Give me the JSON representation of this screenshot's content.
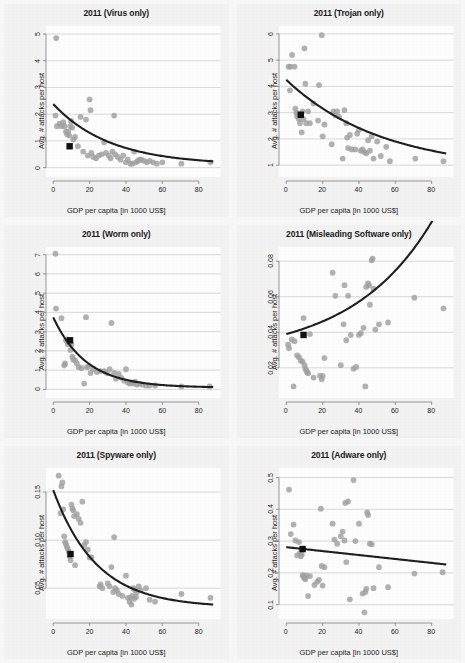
{
  "figure": {
    "title": "",
    "background_color": "#f4f4f4",
    "point_color": "#a0a0a0",
    "line_color": "#1f1f1f",
    "highlight_color": "#111111",
    "grid_color": "#c8c8c8",
    "axis_color": "#8a8a8a"
  },
  "shared": {
    "xlabel": "GDP per capita [in 1000 US$]",
    "ylabel": "Avg. # attacks per host",
    "xticks": [
      "0",
      "20",
      "40",
      "60",
      "80"
    ],
    "xtick_values": [
      0,
      20,
      40,
      60,
      80
    ],
    "xlim": [
      -4,
      92
    ]
  },
  "chart_data": [
    {
      "type": "scatter",
      "title": "2011 (Virus only)",
      "xlabel": "GDP per capita [in 1000 US$]",
      "ylabel": "Avg. # attacks per host",
      "xlim": [
        -4,
        92
      ],
      "ylim": [
        -0.35,
        5.3
      ],
      "xticks": [
        0,
        20,
        40,
        60,
        80
      ],
      "yticks": [
        0,
        1,
        2,
        3,
        4,
        5
      ],
      "ytick_labels": [
        "0",
        "1",
        "2",
        "3",
        "4",
        "5"
      ],
      "grid": true,
      "legend": "none",
      "x": [
        1.6,
        1.2,
        2.0,
        3.5,
        4.5,
        5.5,
        6.2,
        7.0,
        7.6,
        8.2,
        8.8,
        9.4,
        9.8,
        10.4,
        11.0,
        12.0,
        13.5,
        15.0,
        16.5,
        18.0,
        19.0,
        20.0,
        20.5,
        21.0,
        22.0,
        23.5,
        25.0,
        26.5,
        28.0,
        29.0,
        30.5,
        31.5,
        32.5,
        33.5,
        34.0,
        35.5,
        37.0,
        38.5,
        40.0,
        41.0,
        42.5,
        43.5,
        44.5,
        45.5,
        46.5,
        47.5,
        48.5,
        50.0,
        51.5,
        53.0,
        55.0,
        57.0,
        60.0,
        70.5,
        86.5
      ],
      "y": [
        4.85,
        1.95,
        1.55,
        1.65,
        1.55,
        1.7,
        1.55,
        1.35,
        1.25,
        1.35,
        1.2,
        1.55,
        1.75,
        1.5,
        1.05,
        1.15,
        0.8,
        1.9,
        0.6,
        1.8,
        0.45,
        2.55,
        2.15,
        0.55,
        0.4,
        0.35,
        0.45,
        0.5,
        0.95,
        0.55,
        0.45,
        0.35,
        0.6,
        1.95,
        0.5,
        0.4,
        0.3,
        0.45,
        0.2,
        0.3,
        0.15,
        0.15,
        0.6,
        0.2,
        0.25,
        0.3,
        0.3,
        0.25,
        0.2,
        0.25,
        0.2,
        0.15,
        0.2,
        0.15,
        0.2
      ],
      "highlight_point": {
        "x": 9.0,
        "y": 0.8,
        "marker": "square"
      },
      "fit_curve": {
        "kind": "exponential_decay",
        "a": 2.28,
        "b": 0.032,
        "c": 0.1,
        "x0": 0,
        "x1": 88
      }
    },
    {
      "type": "scatter",
      "title": "2011 (Trojan only)",
      "xlabel": "GDP per capita [in 1000 US$]",
      "ylabel": "Avg. # attacks per host",
      "xlim": [
        -4,
        92
      ],
      "ylim": [
        0.55,
        6.3
      ],
      "xticks": [
        0,
        20,
        40,
        60,
        80
      ],
      "yticks": [
        1,
        2,
        3,
        4,
        5,
        6
      ],
      "ytick_labels": [
        "1",
        "2",
        "3",
        "4",
        "5",
        "6"
      ],
      "grid": true,
      "legend": "none",
      "x": [
        1.3,
        2.0,
        2.2,
        3.2,
        4.5,
        5.0,
        5.5,
        6.0,
        6.5,
        7.0,
        7.5,
        8.0,
        8.5,
        9.0,
        9.5,
        10.0,
        10.5,
        11.0,
        12.0,
        13.0,
        15.0,
        17.5,
        18.0,
        19.5,
        20.0,
        21.0,
        25.0,
        26.0,
        27.0,
        28.0,
        29.0,
        31.0,
        32.0,
        33.0,
        33.5,
        34.0,
        35.0,
        36.0,
        38.0,
        39.0,
        40.0,
        41.0,
        42.0,
        43.0,
        44.0,
        45.0,
        46.0,
        47.0,
        48.0,
        50.0,
        52.0,
        55.0,
        57.0,
        71.0,
        86.5
      ],
      "y": [
        4.75,
        3.85,
        4.75,
        5.2,
        4.75,
        3.15,
        3.0,
        2.85,
        2.95,
        2.75,
        2.6,
        2.95,
        2.25,
        3.05,
        2.75,
        5.45,
        4.1,
        2.6,
        3.05,
        2.6,
        3.35,
        2.7,
        4.05,
        5.95,
        2.1,
        2.55,
        1.8,
        3.05,
        2.9,
        3.05,
        2.85,
        1.25,
        3.1,
        2.6,
        2.05,
        1.65,
        2.15,
        1.6,
        1.6,
        2.2,
        2.35,
        1.55,
        1.6,
        1.5,
        1.45,
        1.95,
        1.55,
        2.1,
        1.25,
        1.9,
        1.35,
        1.7,
        1.15,
        1.25,
        1.15
      ],
      "highlight_point": {
        "x": 8.0,
        "y": 2.92,
        "marker": "square"
      },
      "fit_curve": {
        "kind": "exponential_decay",
        "a": 3.45,
        "b": 0.019,
        "c": 0.8,
        "x0": 0,
        "x1": 88
      }
    },
    {
      "type": "scatter",
      "title": "2011 (Worm only)",
      "xlabel": "GDP per capita [in 1000 US$]",
      "ylabel": "Avg. # attacks per host",
      "xlim": [
        -4,
        92
      ],
      "ylim": [
        -0.45,
        7.4
      ],
      "xticks": [
        0,
        20,
        40,
        60,
        80
      ],
      "yticks": [
        0,
        1,
        2,
        3,
        4,
        5,
        6,
        7
      ],
      "ytick_labels": [
        "0",
        "1",
        "2",
        "3",
        "4",
        "5",
        "6",
        "7"
      ],
      "grid": true,
      "legend": "none",
      "x": [
        1.2,
        1.5,
        4.5,
        6.0,
        6.5,
        7.0,
        7.5,
        8.0,
        8.5,
        9.0,
        9.5,
        10.0,
        10.5,
        11.0,
        12.0,
        13.0,
        14.0,
        15.5,
        17.0,
        18.0,
        18.5,
        19.5,
        20.5,
        22.0,
        24.0,
        26.0,
        28.0,
        29.5,
        31.0,
        32.0,
        33.5,
        34.5,
        36.0,
        37.5,
        39.0,
        40.0,
        41.0,
        42.0,
        43.0,
        44.0,
        45.0,
        46.0,
        47.5,
        49.0,
        51.0,
        53.0,
        56.0,
        70.5,
        86.0
      ],
      "y": [
        7.05,
        4.2,
        3.7,
        1.25,
        1.35,
        2.55,
        2.6,
        2.35,
        2.5,
        2.4,
        2.05,
        2.35,
        1.7,
        1.55,
        1.5,
        1.35,
        1.15,
        1.1,
        0.3,
        3.75,
        1.15,
        1.2,
        0.85,
        1.05,
        0.9,
        0.95,
        0.95,
        0.85,
        1.05,
        3.45,
        0.85,
        0.55,
        0.8,
        0.6,
        0.45,
        1.05,
        0.35,
        0.3,
        0.35,
        0.3,
        0.4,
        0.25,
        0.3,
        0.25,
        0.2,
        0.2,
        0.2,
        0.15,
        0.15
      ],
      "highlight_point": {
        "x": 9.2,
        "y": 2.55,
        "marker": "square"
      },
      "fit_curve": {
        "kind": "exponential_decay",
        "a": 3.65,
        "b": 0.055,
        "c": 0.09,
        "x0": 0,
        "x1": 88
      }
    },
    {
      "type": "scatter",
      "title": "2011 (Misleading Software only)",
      "xlabel": "GDP per capita [in 1000 US$]",
      "ylabel": "Avg. # attacks per host",
      "xlim": [
        -4,
        92
      ],
      "ylim": [
        0.003,
        0.088
      ],
      "xticks": [
        0,
        20,
        40,
        60,
        80
      ],
      "yticks": [
        0.02,
        0.04,
        0.06,
        0.08
      ],
      "ytick_labels": [
        "0.02",
        "0.04",
        "0.06",
        "0.08"
      ],
      "grid": true,
      "legend": "none",
      "x": [
        1.0,
        1.5,
        3.0,
        4.0,
        4.5,
        6.0,
        7.0,
        8.0,
        9.0,
        9.5,
        10.0,
        10.5,
        11.0,
        11.5,
        12.0,
        13.0,
        15.0,
        18.5,
        19.5,
        20.0,
        21.0,
        25.5,
        27.0,
        30.0,
        31.5,
        32.0,
        33.0,
        34.0,
        35.5,
        37.0,
        38.5,
        40.0,
        41.0,
        42.5,
        43.5,
        44.0,
        45.0,
        45.5,
        46.0,
        47.0,
        47.5,
        48.0,
        49.0,
        51.0,
        56.0,
        70.5,
        86.5
      ],
      "y": [
        0.033,
        0.031,
        0.036,
        0.0095,
        0.035,
        0.027,
        0.026,
        0.024,
        0.0235,
        0.048,
        0.0215,
        0.0195,
        0.0185,
        0.0175,
        0.017,
        0.039,
        0.0145,
        0.0155,
        0.0135,
        0.0155,
        0.0255,
        0.0735,
        0.0605,
        0.0215,
        0.0445,
        0.0665,
        0.0355,
        0.0605,
        0.0385,
        0.0195,
        0.0205,
        0.0385,
        0.0395,
        0.0425,
        0.0095,
        0.0655,
        0.0675,
        0.0665,
        0.0555,
        0.0805,
        0.0815,
        0.0645,
        0.0415,
        0.0445,
        0.0455,
        0.0595,
        0.0535
      ],
      "highlight_point": {
        "x": 9.5,
        "y": 0.0385,
        "marker": "square"
      },
      "fit_curve": {
        "kind": "exponential_growth",
        "a": 0.0265,
        "b": 0.0125,
        "k": 0.0225,
        "x0": 0,
        "x1": 88
      }
    },
    {
      "type": "scatter",
      "title": "2011 (Spyware only)",
      "xlabel": "GDP per capita [in 1000 US$]",
      "ylabel": "Avg. # attacks per host",
      "xlim": [
        -4,
        92
      ],
      "ylim": [
        0.018,
        0.175
      ],
      "xticks": [
        0,
        20,
        40,
        60,
        80
      ],
      "yticks": [
        0.05,
        0.1,
        0.15
      ],
      "ytick_labels": [
        "0.05",
        "0.10",
        "0.15"
      ],
      "grid": true,
      "legend": "none",
      "x": [
        3.0,
        4.0,
        4.5,
        5.0,
        5.5,
        6.0,
        6.5,
        7.0,
        7.5,
        8.0,
        8.5,
        9.0,
        9.5,
        10.0,
        10.5,
        11.0,
        11.5,
        12.0,
        13.0,
        14.0,
        15.0,
        16.0,
        17.0,
        18.0,
        19.0,
        20.0,
        21.0,
        25.5,
        26.0,
        27.0,
        30.0,
        31.0,
        32.0,
        33.0,
        33.5,
        34.0,
        35.0,
        36.0,
        38.0,
        40.0,
        41.0,
        42.0,
        42.5,
        43.0,
        43.5,
        44.0,
        44.5,
        45.0,
        45.5,
        46.0,
        47.0,
        48.0,
        51.0,
        53.0,
        56.0,
        70.5,
        86.5
      ],
      "y": [
        0.167,
        0.128,
        0.156,
        0.16,
        0.132,
        0.104,
        0.098,
        0.096,
        0.093,
        0.091,
        0.088,
        0.083,
        0.079,
        0.137,
        0.133,
        0.131,
        0.125,
        0.074,
        0.127,
        0.122,
        0.118,
        0.14,
        0.095,
        0.098,
        0.09,
        0.082,
        0.082,
        0.052,
        0.054,
        0.05,
        0.055,
        0.052,
        0.072,
        0.046,
        0.103,
        0.05,
        0.048,
        0.044,
        0.042,
        0.063,
        0.04,
        0.036,
        0.04,
        0.033,
        0.042,
        0.05,
        0.039,
        0.048,
        0.041,
        0.046,
        0.052,
        0.048,
        0.05,
        0.038,
        0.036,
        0.044,
        0.04
      ],
      "highlight_point": {
        "x": 9.5,
        "y": 0.0855,
        "marker": "square"
      },
      "fit_curve": {
        "kind": "exponential_decay",
        "a": 0.122,
        "b": 0.042,
        "c": 0.03,
        "x0": 0,
        "x1": 88
      }
    },
    {
      "type": "scatter",
      "title": "2011 (Adware only)",
      "xlabel": "GDP per capita [in 1000 US$]",
      "ylabel": "Avg. # attacks per host",
      "xlim": [
        -4,
        92
      ],
      "ylim": [
        0.055,
        0.53
      ],
      "xticks": [
        0,
        20,
        40,
        60,
        80
      ],
      "yticks": [
        0.1,
        0.2,
        0.3,
        0.4,
        0.5
      ],
      "ytick_labels": [
        "0.1",
        "0.2",
        "0.3",
        "0.4",
        "0.5"
      ],
      "grid": true,
      "legend": "none",
      "x": [
        1.5,
        2.5,
        4.0,
        5.0,
        6.0,
        7.0,
        7.5,
        8.0,
        8.5,
        9.0,
        9.5,
        10.0,
        10.5,
        11.0,
        12.0,
        13.0,
        15.5,
        17.0,
        18.0,
        19.0,
        19.5,
        20.0,
        21.0,
        25.5,
        26.5,
        28.0,
        30.0,
        31.0,
        32.0,
        32.5,
        33.0,
        34.0,
        35.0,
        37.0,
        38.0,
        40.0,
        42.0,
        43.0,
        43.5,
        44.0,
        44.5,
        45.0,
        46.0,
        47.0,
        48.0,
        51.0,
        56.0,
        70.5,
        86.0
      ],
      "y": [
        0.462,
        0.322,
        0.352,
        0.302,
        0.255,
        0.297,
        0.262,
        0.252,
        0.258,
        0.193,
        0.188,
        0.185,
        0.18,
        0.192,
        0.127,
        0.19,
        0.162,
        0.172,
        0.178,
        0.402,
        0.222,
        0.16,
        0.218,
        0.355,
        0.305,
        0.292,
        0.315,
        0.33,
        0.302,
        0.42,
        0.234,
        0.425,
        0.117,
        0.492,
        0.3,
        0.355,
        0.135,
        0.076,
        0.14,
        0.15,
        0.39,
        0.382,
        0.292,
        0.29,
        0.152,
        0.218,
        0.155,
        0.198,
        0.202
      ],
      "highlight_point": {
        "x": 9.0,
        "y": 0.275,
        "marker": "square"
      },
      "fit_curve": {
        "kind": "linear",
        "intercept": 0.281,
        "slope": -0.00062,
        "x0": 0,
        "x1": 88
      }
    }
  ]
}
